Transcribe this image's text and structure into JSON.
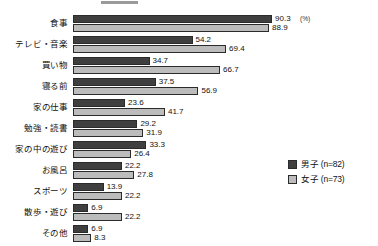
{
  "chart_data": {
    "type": "bar",
    "orientation": "horizontal",
    "title": "",
    "xlabel": "",
    "ylabel": "",
    "unit_label": "(%)",
    "xlim": [
      0,
      100
    ],
    "grid": false,
    "legend_position": "right-bottom",
    "categories": [
      "食事",
      "テレビ・音楽",
      "買い物",
      "寝る前",
      "家の仕事",
      "勉強・読書",
      "家の中の遊び",
      "お風呂",
      "スポーツ",
      "散歩・遊び",
      "その他"
    ],
    "series": [
      {
        "name": "男子 (n=82)",
        "color": "#3f3f3f",
        "values": [
          90.3,
          54.2,
          34.7,
          37.5,
          23.6,
          29.2,
          33.3,
          22.2,
          13.9,
          6.9,
          6.9
        ]
      },
      {
        "name": "女子 (n=73)",
        "color": "#bcbcbc",
        "values": [
          88.9,
          69.4,
          66.7,
          56.9,
          41.7,
          31.9,
          26.4,
          27.8,
          22.2,
          22.2,
          8.3
        ]
      }
    ]
  },
  "legend": {
    "items": [
      {
        "label": "男子 (n=82)",
        "color": "#3f3f3f"
      },
      {
        "label": "女子 (n=73)",
        "color": "#bcbcbc"
      }
    ]
  }
}
